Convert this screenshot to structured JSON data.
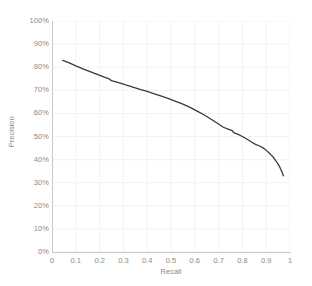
{
  "chart_data": {
    "type": "line",
    "title": "",
    "subtitle": "",
    "xlabel": "Recall",
    "ylabel": "Precision",
    "xlim": [
      0,
      1
    ],
    "ylim": [
      0,
      100
    ],
    "grid": true,
    "legend": null,
    "legend_position": "none",
    "series_color": "#3a3a3a",
    "grid_color": "#f2f2f2",
    "axis_color": "#c8c8c8",
    "tick_label_color": "#8a8a8a",
    "x_ticks": [
      "0",
      "0.1",
      "0.2",
      "0.3",
      "0.4",
      "0.5",
      "0.6",
      "0.7",
      "0.8",
      "0.9",
      "1"
    ],
    "x_tick_values": [
      0,
      0.1,
      0.2,
      0.3,
      0.4,
      0.5,
      0.6,
      0.7,
      0.8,
      0.9,
      1
    ],
    "y_ticks": [
      "0%",
      "10%",
      "20%",
      "30%",
      "40%",
      "50%",
      "60%",
      "70%",
      "80%",
      "90%",
      "100%"
    ],
    "y_tick_values": [
      0,
      10,
      20,
      30,
      40,
      50,
      60,
      70,
      80,
      90,
      100
    ],
    "series": [
      {
        "name": "Precision-Recall",
        "x": [
          0.045,
          0.07,
          0.1,
          0.13,
          0.16,
          0.19,
          0.22,
          0.24,
          0.25,
          0.28,
          0.31,
          0.34,
          0.37,
          0.4,
          0.43,
          0.46,
          0.49,
          0.52,
          0.55,
          0.58,
          0.61,
          0.64,
          0.66,
          0.68,
          0.7,
          0.72,
          0.74,
          0.755,
          0.765,
          0.78,
          0.8,
          0.82,
          0.84,
          0.855,
          0.87,
          0.885,
          0.9,
          0.915,
          0.93,
          0.945,
          0.955,
          0.962,
          0.968,
          0.972
        ],
        "y": [
          83.0,
          82.0,
          80.6,
          79.3,
          78.1,
          76.9,
          75.7,
          74.9,
          74.2,
          73.3,
          72.3,
          71.4,
          70.4,
          69.5,
          68.5,
          67.5,
          66.4,
          65.2,
          64.0,
          62.6,
          61.0,
          59.3,
          58.0,
          56.7,
          55.4,
          54.0,
          53.2,
          52.7,
          51.6,
          51.0,
          50.0,
          48.8,
          47.5,
          46.6,
          46.0,
          45.2,
          44.0,
          42.6,
          41.0,
          38.8,
          37.2,
          35.6,
          34.2,
          33.0
        ]
      }
    ]
  }
}
